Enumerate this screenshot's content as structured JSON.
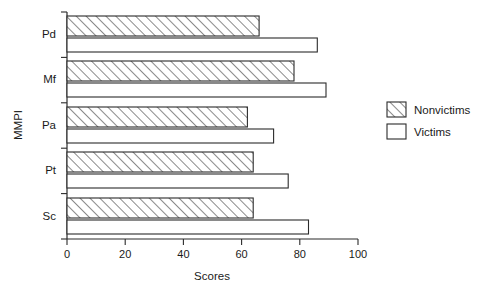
{
  "chart_data": {
    "type": "bar",
    "orientation": "horizontal",
    "title": "",
    "xlabel": "Scores",
    "ylabel": "MMPI",
    "categories": [
      "Pd",
      "Mf",
      "Pa",
      "Pt",
      "Sc"
    ],
    "xlim": [
      0,
      100
    ],
    "xticks": [
      0,
      20,
      40,
      60,
      80,
      100
    ],
    "xtick_labels": [
      "0",
      "20",
      "40",
      "60",
      "80",
      "100"
    ],
    "grid": false,
    "legend_position": "right",
    "series": [
      {
        "name": "Nonvictims",
        "fill": "hatch",
        "values": [
          66,
          78,
          62,
          64,
          64
        ]
      },
      {
        "name": "Victims",
        "fill": "white",
        "values": [
          86,
          89,
          71,
          76,
          83
        ]
      }
    ]
  },
  "axes": {
    "y_axis_title": "MMPI",
    "x_axis_title": "Scores",
    "category_labels": [
      "Pd",
      "Mf",
      "Pa",
      "Pt",
      "Sc"
    ],
    "x_tick_labels": [
      "0",
      "20",
      "40",
      "60",
      "80",
      "100"
    ]
  },
  "legend": {
    "items": [
      {
        "label": "Nonvictims",
        "swatch": "hatched-swatch"
      },
      {
        "label": "Victims",
        "swatch": "empty-swatch"
      }
    ]
  },
  "colors": {
    "ink": "#2b2b2b",
    "background": "#ffffff",
    "bar_fill_victims": "#ffffff",
    "hatch_stroke": "#2b2b2b"
  }
}
